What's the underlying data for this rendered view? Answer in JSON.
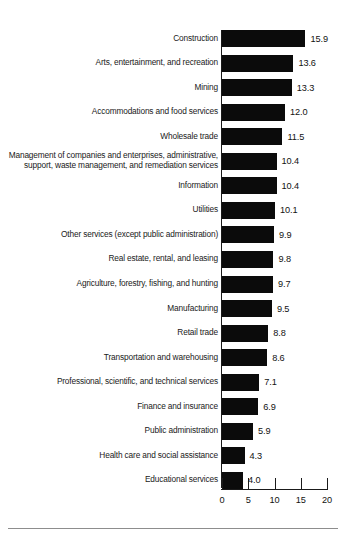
{
  "chart_data": {
    "type": "bar",
    "orientation": "horizontal",
    "title": "",
    "subtitle": "",
    "xlabel": "",
    "ylabel": "",
    "xlim": [
      0,
      20
    ],
    "grid": false,
    "legend": null,
    "bar_color": "#0b0b0b",
    "value_label_format": "one-decimal",
    "xticks": [
      "0",
      "5",
      "10",
      "15",
      "20"
    ],
    "xtick_values": [
      0,
      5,
      10,
      15,
      20
    ],
    "categories": [
      "Construction",
      "Arts, entertainment, and recreation",
      "Mining",
      "Accommodations and food services",
      "Wholesale trade",
      "Management of companies and enterprises, administrative,\nsupport, waste management, and remediation services",
      "Information",
      "Utilities",
      "Other services (except public administration)",
      "Real estate, rental, and leasing",
      "Agriculture, forestry, fishing, and hunting",
      "Manufacturing",
      "Retail trade",
      "Transportation and warehousing",
      "Professional, scientific, and technical services",
      "Finance and insurance",
      "Public administration",
      "Health care and social assistance",
      "Educational services"
    ],
    "values": [
      15.9,
      13.6,
      13.3,
      12.0,
      11.5,
      10.4,
      10.4,
      10.1,
      9.9,
      9.8,
      9.7,
      9.5,
      8.8,
      8.6,
      7.1,
      6.9,
      5.9,
      4.3,
      4.0
    ],
    "value_labels": [
      "15.9",
      "13.6",
      "13.3",
      "12.0",
      "11.5",
      "10.4",
      "10.4",
      "10.1",
      "9.9",
      "9.8",
      "9.7",
      "9.5",
      "8.8",
      "8.6",
      "7.1",
      "6.9",
      "5.9",
      "4.3",
      "4.0"
    ]
  }
}
